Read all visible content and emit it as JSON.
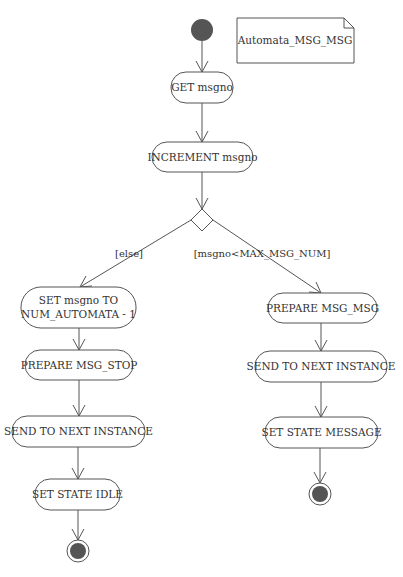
{
  "diagram": {
    "type": "uml-activity",
    "note": {
      "label": "Automata_MSG_MSG"
    },
    "initial_node": {
      "label": ""
    },
    "actions": {
      "get_msgno": "GET msgno",
      "increment_msgno": "INCREMENT msgno",
      "set_msgno_line1": "SET msgno TO",
      "set_msgno_line2": "NUM_AUTOMATA - 1",
      "prepare_msg_stop": "PREPARE MSG_STOP",
      "send_left": "SEND TO NEXT INSTANCE",
      "set_state_idle": "SET STATE IDLE",
      "prepare_msg_msg": "PREPARE MSG_MSG",
      "send_right": "SEND TO NEXT INSTANCE",
      "set_state_message": "SET STATE MESSAGE"
    },
    "guards": {
      "else": "[else]",
      "less_than_max": "[msgno<MAX_MSG_NUM]"
    },
    "colors": {
      "stroke": "#555555",
      "node_fill": "#555555",
      "text": "#333333",
      "background": "#ffffff"
    }
  }
}
